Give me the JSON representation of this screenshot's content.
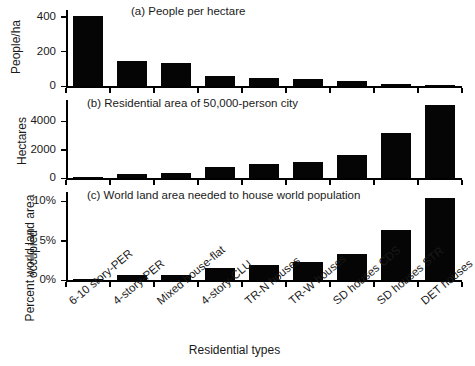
{
  "figure": {
    "xaxis_title": "Residential types",
    "background": "#ffffff",
    "bar_color": "#050505"
  },
  "panels": [
    {
      "id": "panel-a",
      "title": "(a) People per hectare",
      "ylabel": "People/ha",
      "ytick_labels": [
        "0",
        "200",
        "400"
      ]
    },
    {
      "id": "panel-b",
      "title": "(b) Residential area of 50,000-person city",
      "ylabel": "Hectares",
      "ytick_labels": [
        "0",
        "2,000",
        "4,000"
      ]
    },
    {
      "id": "panel-c",
      "title": "(c) World land area needed to house world population",
      "ylabel_line1": "Percent world land area",
      "ylabel_line2": "occupied",
      "ytick_labels": [
        "0%",
        "5%",
        "10%"
      ]
    }
  ],
  "chart_data": [
    {
      "type": "bar",
      "title": "(a) People per hectare",
      "xlabel": "Residential types",
      "ylabel": "People/ha",
      "categories": [
        "6-10 story-PER",
        "4-story-PER",
        "Mixed house-flat",
        "4-story-CLU",
        "TR-N houses",
        "TR-W houses",
        "SD houses CDS",
        "SD houses STR",
        "DET houses"
      ],
      "values": [
        405,
        148,
        135,
        62,
        50,
        43,
        30,
        13,
        7
      ],
      "yticks": [
        0,
        200,
        400
      ],
      "ylim": [
        0,
        440
      ],
      "grid": false,
      "legend": false
    },
    {
      "type": "bar",
      "title": "(b) Residential area of 50,000-person city",
      "xlabel": "Residential types",
      "ylabel": "Hectares",
      "categories": [
        "6-10 story-PER",
        "4-story-PER",
        "Mixed house-flat",
        "4-story-CLU",
        "TR-N houses",
        "TR-W houses",
        "SD houses CDS",
        "SD houses STR",
        "DET houses"
      ],
      "values": [
        123,
        338,
        370,
        806,
        1000,
        1163,
        1667,
        3205,
        5155
      ],
      "yticks": [
        0,
        2000,
        4000
      ],
      "ylim": [
        0,
        5500
      ],
      "grid": false,
      "legend": false
    },
    {
      "type": "bar",
      "title": "(c) World land area needed to house world population",
      "xlabel": "Residential types",
      "ylabel": "Percent world land area occupied",
      "categories": [
        "6-10 story-PER",
        "4-story-PER",
        "Mixed house-flat",
        "4-story-CLU",
        "TR-N houses",
        "TR-W houses",
        "SD houses CDS",
        "SD houses STR",
        "DET houses"
      ],
      "values": [
        0.23,
        0.63,
        0.7,
        1.52,
        2.0,
        2.3,
        3.3,
        6.4,
        10.4
      ],
      "yticks": [
        0,
        5,
        10
      ],
      "ytick_labels": [
        "0%",
        "5%",
        "10%"
      ],
      "ylim": [
        0,
        11.2
      ],
      "grid": false,
      "legend": false
    }
  ]
}
